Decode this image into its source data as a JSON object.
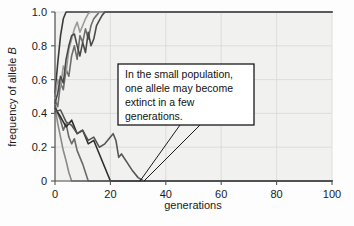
{
  "figure": {
    "background_color": "#fdfdfd",
    "plot_background_color": "#f1f1ef",
    "grid_color": "#d8d8d6",
    "axis_color": "#555555"
  },
  "callout": {
    "name": "annotation-callout",
    "line1": "In the small population,",
    "line2": "one allele may become",
    "line3": "extinct in a few",
    "line4": "generations.",
    "full_text": "In the small population, one allele may become extinct in a few generations.",
    "border_color": "#1a1a1a",
    "fill_color": "#ffffff"
  },
  "chart_data": {
    "type": "line",
    "title": "",
    "subtitle": "",
    "xlabel": "generations",
    "ylabel": "frequency of allele B",
    "ylabel_italic_part": "B",
    "xlim": [
      0,
      100
    ],
    "ylim": [
      0,
      1.0
    ],
    "xticks": [
      0,
      20,
      40,
      60,
      80,
      100
    ],
    "xtick_labels": [
      "0",
      "20",
      "40",
      "60",
      "80",
      "100"
    ],
    "yticks": [
      0,
      0.2,
      0.4,
      0.6,
      0.8,
      1.0
    ],
    "ytick_labels": [
      "0",
      "0.2",
      "0.4",
      "0.6",
      "0.8",
      "1.0"
    ],
    "grid": true,
    "legend": false,
    "legend_position": "none",
    "annotations": [
      {
        "text": "In the small population, one allele may become extinct in a few generations.",
        "points_to_x": 31,
        "points_to_y": 0
      }
    ],
    "series": [
      {
        "name": "replicate-1",
        "color": "#3a3a3a",
        "width": 1.6,
        "fixed_at": 1.0,
        "fixation_generation": 4,
        "x": [
          0,
          1,
          2,
          3,
          4,
          5,
          10,
          20,
          40,
          60,
          80,
          100
        ],
        "values": [
          0.52,
          0.7,
          0.86,
          0.96,
          1.0,
          1.0,
          1.0,
          1.0,
          1.0,
          1.0,
          1.0,
          1.0
        ]
      },
      {
        "name": "replicate-2",
        "color": "#6e6e6e",
        "width": 1.6,
        "fixed_at": 1.0,
        "fixation_generation": 16,
        "x": [
          0,
          1,
          2,
          3,
          4,
          5,
          6,
          7,
          8,
          9,
          10,
          11,
          12,
          13,
          14,
          15,
          16,
          30,
          60,
          100
        ],
        "values": [
          0.48,
          0.44,
          0.58,
          0.54,
          0.66,
          0.62,
          0.74,
          0.8,
          0.72,
          0.86,
          0.82,
          0.9,
          0.84,
          0.92,
          0.96,
          0.98,
          1.0,
          1.0,
          1.0,
          1.0
        ]
      },
      {
        "name": "replicate-3",
        "color": "#9a9a9a",
        "width": 1.6,
        "fixed_at": 1.0,
        "fixation_generation": 13,
        "x": [
          0,
          1,
          2,
          3,
          4,
          5,
          6,
          7,
          8,
          9,
          10,
          11,
          12,
          13,
          30,
          60,
          100
        ],
        "values": [
          0.5,
          0.6,
          0.56,
          0.68,
          0.64,
          0.78,
          0.84,
          0.9,
          0.94,
          0.88,
          0.92,
          0.96,
          0.99,
          1.0,
          1.0,
          1.0,
          1.0
        ]
      },
      {
        "name": "replicate-4",
        "color": "#4a4a4a",
        "width": 1.6,
        "fixed_at": 1.0,
        "fixation_generation": 18,
        "x": [
          0,
          1,
          2,
          3,
          4,
          5,
          6,
          7,
          8,
          9,
          10,
          11,
          12,
          13,
          14,
          15,
          16,
          17,
          18,
          40,
          70,
          100
        ],
        "values": [
          0.46,
          0.52,
          0.62,
          0.58,
          0.72,
          0.8,
          0.86,
          0.87,
          0.8,
          0.74,
          0.82,
          0.76,
          0.88,
          0.8,
          0.84,
          0.92,
          0.95,
          0.98,
          1.0,
          1.0,
          1.0,
          1.0
        ]
      },
      {
        "name": "replicate-5",
        "color": "#8a8a8a",
        "width": 1.6,
        "fixed_at": 0.0,
        "fixation_generation": 6,
        "x": [
          0,
          1,
          2,
          3,
          4,
          5,
          6,
          20,
          50,
          100
        ],
        "values": [
          0.44,
          0.34,
          0.26,
          0.18,
          0.12,
          0.05,
          0.0,
          0.0,
          0.0,
          0.0
        ]
      },
      {
        "name": "replicate-6",
        "color": "#6a6a6a",
        "width": 1.6,
        "fixed_at": 0.0,
        "fixation_generation": 12,
        "x": [
          0,
          1,
          2,
          3,
          4,
          5,
          6,
          7,
          8,
          9,
          10,
          11,
          12,
          40,
          80,
          100
        ],
        "values": [
          0.45,
          0.4,
          0.36,
          0.3,
          0.34,
          0.26,
          0.22,
          0.25,
          0.18,
          0.14,
          0.1,
          0.05,
          0.0,
          0.0,
          0.0,
          0.0
        ]
      },
      {
        "name": "replicate-7",
        "color": "#2e2e2e",
        "width": 1.6,
        "fixed_at": 0.0,
        "fixation_generation": 20,
        "x": [
          0,
          2,
          4,
          6,
          8,
          10,
          12,
          14,
          16,
          18,
          19,
          20,
          50,
          100
        ],
        "values": [
          0.43,
          0.38,
          0.32,
          0.36,
          0.28,
          0.3,
          0.22,
          0.24,
          0.16,
          0.08,
          0.04,
          0.0,
          0.0,
          0.0
        ]
      },
      {
        "name": "replicate-8",
        "color": "#555555",
        "width": 1.6,
        "fixed_at": 0.0,
        "fixation_generation": 32,
        "x": [
          0,
          2,
          4,
          6,
          8,
          10,
          12,
          14,
          16,
          18,
          20,
          21,
          22,
          23,
          24,
          26,
          28,
          30,
          32,
          60,
          100
        ],
        "values": [
          0.41,
          0.42,
          0.35,
          0.33,
          0.28,
          0.3,
          0.24,
          0.26,
          0.2,
          0.22,
          0.26,
          0.28,
          0.24,
          0.14,
          0.16,
          0.11,
          0.06,
          0.02,
          0.0,
          0.0,
          0.0
        ]
      }
    ]
  }
}
